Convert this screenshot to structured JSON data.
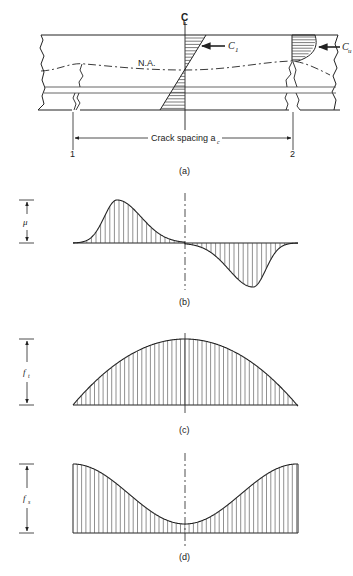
{
  "figure": {
    "panel_a": {
      "centerline_label": "C",
      "centerline_sub": "L",
      "neutral_axis_label": "N.A.",
      "c1_label": "C",
      "c1_sub": "1",
      "cu_label": "C",
      "cu_sub": "u",
      "crack_spacing_label": "Crack spacing a",
      "crack_spacing_sub": "c",
      "crack_1_label": "1",
      "crack_2_label": "2",
      "caption": "(a)"
    },
    "panel_b": {
      "dimension_label": "μ",
      "caption": "(b)",
      "description": "bond stress distribution between cracks"
    },
    "panel_c": {
      "dimension_label": "f",
      "dimension_sub": "t",
      "caption": "(c)",
      "description": "concrete tensile stress distribution"
    },
    "panel_d": {
      "dimension_label": "f",
      "dimension_sub": "s",
      "caption": "(d)",
      "description": "steel stress distribution"
    }
  }
}
